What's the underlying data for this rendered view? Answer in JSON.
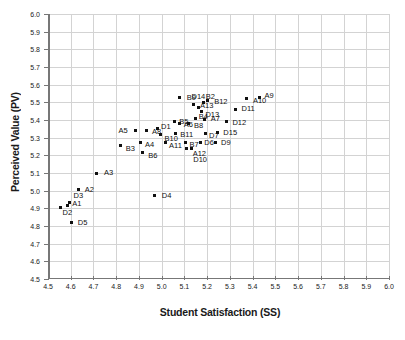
{
  "chart_data": {
    "type": "scatter",
    "title": "",
    "xlabel": "Student Satisfaction (SS)",
    "ylabel": "Perceived Value (PV)",
    "xlim": [
      4.5,
      6.0
    ],
    "ylim": [
      4.5,
      6.0
    ],
    "xticks": [
      "4.5",
      "4.6",
      "4.7",
      "4.8",
      "4.9",
      "5.0",
      "5.1",
      "5.2",
      "5.3",
      "5.4",
      "5.5",
      "5.6",
      "5.7",
      "5.8",
      "5.9",
      "6.0"
    ],
    "yticks": [
      "4.5",
      "4.6",
      "4.7",
      "4.8",
      "4.9",
      "5.0",
      "5.1",
      "5.2",
      "5.3",
      "5.4",
      "5.5",
      "5.6",
      "5.7",
      "5.8",
      "5.9",
      "6.0"
    ],
    "grid": true,
    "legend": "none",
    "marker_color": "#111111",
    "grid_color": "#d3d3d3",
    "axis_color": "#777777",
    "points": [
      {
        "label": "A1",
        "x": 4.585,
        "y": 4.915,
        "lx": 5,
        "ly": -2
      },
      {
        "label": "D2",
        "x": 4.555,
        "y": 4.905,
        "lx": 2,
        "ly": 6
      },
      {
        "label": "D3",
        "x": 4.595,
        "y": 4.935,
        "lx": 4,
        "ly": -6
      },
      {
        "label": "D5",
        "x": 4.605,
        "y": 4.82,
        "lx": 6,
        "ly": 1
      },
      {
        "label": "A2",
        "x": 4.635,
        "y": 5.005,
        "lx": 6,
        "ly": 0
      },
      {
        "label": "A3",
        "x": 4.715,
        "y": 5.1,
        "lx": 7,
        "ly": 0
      },
      {
        "label": "B3",
        "x": 4.82,
        "y": 5.255,
        "lx": 5,
        "ly": 3
      },
      {
        "label": "A5",
        "x": 4.885,
        "y": 5.34,
        "lx": -17,
        "ly": 0
      },
      {
        "label": "A4",
        "x": 4.905,
        "y": 5.27,
        "lx": 5,
        "ly": 2
      },
      {
        "label": "B6",
        "x": 4.915,
        "y": 5.215,
        "lx": 6,
        "ly": 3
      },
      {
        "label": "A8",
        "x": 4.935,
        "y": 5.34,
        "lx": 5,
        "ly": 1
      },
      {
        "label": "D4",
        "x": 4.97,
        "y": 4.97,
        "lx": 7,
        "ly": 0
      },
      {
        "label": "D1",
        "x": 4.98,
        "y": 5.35,
        "lx": 4,
        "ly": -2
      },
      {
        "label": "B10",
        "x": 4.995,
        "y": 5.32,
        "lx": 4,
        "ly": 5
      },
      {
        "label": "A11",
        "x": 5.015,
        "y": 5.275,
        "lx": 4,
        "ly": 4
      },
      {
        "label": "B5",
        "x": 5.055,
        "y": 5.39,
        "lx": 5,
        "ly": 0
      },
      {
        "label": "B11",
        "x": 5.06,
        "y": 5.325,
        "lx": 5,
        "ly": 2
      },
      {
        "label": "A6",
        "x": 5.08,
        "y": 5.38,
        "lx": 4,
        "ly": 1
      },
      {
        "label": "B9",
        "x": 5.08,
        "y": 5.53,
        "lx": 7,
        "ly": 1
      },
      {
        "label": "B7",
        "x": 5.105,
        "y": 5.275,
        "lx": 4,
        "ly": 3
      },
      {
        "label": "A12",
        "x": 5.11,
        "y": 5.24,
        "lx": 6,
        "ly": 6
      },
      {
        "label": "B8",
        "x": 5.12,
        "y": 5.38,
        "lx": 5,
        "ly": 2
      },
      {
        "label": "D10",
        "x": 5.13,
        "y": 5.24,
        "lx": 2,
        "ly": 12
      },
      {
        "label": "D14",
        "x": 5.14,
        "y": 5.49,
        "lx": -2,
        "ly": -7
      },
      {
        "label": "B4",
        "x": 5.15,
        "y": 5.41,
        "lx": 3,
        "ly": -1
      },
      {
        "label": "A13",
        "x": 5.16,
        "y": 5.47,
        "lx": 2,
        "ly": -2
      },
      {
        "label": "D6",
        "x": 5.17,
        "y": 5.275,
        "lx": 4,
        "ly": 1
      },
      {
        "label": "D13",
        "x": 5.175,
        "y": 5.45,
        "lx": 4,
        "ly": 4
      },
      {
        "label": "B2",
        "x": 5.185,
        "y": 5.5,
        "lx": 2,
        "ly": -5
      },
      {
        "label": "A7",
        "x": 5.19,
        "y": 5.405,
        "lx": 6,
        "ly": 0
      },
      {
        "label": "D7",
        "x": 5.195,
        "y": 5.325,
        "lx": 3,
        "ly": 3
      },
      {
        "label": "B12",
        "x": 5.2,
        "y": 5.51,
        "lx": 7,
        "ly": 1
      },
      {
        "label": "D9",
        "x": 5.235,
        "y": 5.275,
        "lx": 6,
        "ly": 1
      },
      {
        "label": "D15",
        "x": 5.245,
        "y": 5.33,
        "lx": 6,
        "ly": 1
      },
      {
        "label": "D12",
        "x": 5.285,
        "y": 5.39,
        "lx": 6,
        "ly": 1
      },
      {
        "label": "D11",
        "x": 5.325,
        "y": 5.46,
        "lx": 6,
        "ly": 0
      },
      {
        "label": "A10",
        "x": 5.375,
        "y": 5.52,
        "lx": 6,
        "ly": 2
      },
      {
        "label": "A9",
        "x": 5.43,
        "y": 5.53,
        "lx": 5,
        "ly": -1
      }
    ]
  }
}
